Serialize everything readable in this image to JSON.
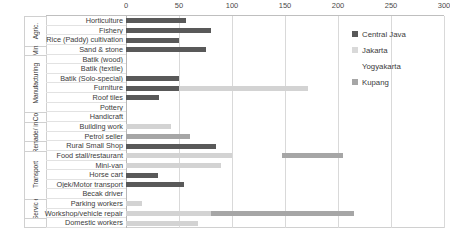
{
  "chart_data": {
    "type": "bar",
    "orientation": "horizontal",
    "title": "",
    "xlabel": "",
    "ylabel": "",
    "xlim": [
      0,
      300
    ],
    "xticks": [
      0,
      50,
      100,
      150,
      200,
      250,
      300
    ],
    "grid": true,
    "legend_position": "top-right",
    "legend": [
      "Central Java",
      "Jakarta",
      "Yogyakarta",
      "Kupang"
    ],
    "colors": {
      "Central Java": "#595959",
      "Jakarta": "#d3d3d3",
      "Yogyakarta": "#f2f2f2",
      "Kupang": "#a6a6a6"
    },
    "groups": [
      {
        "label": "Agric.",
        "rows": 3
      },
      {
        "label": "Min.",
        "rows": 1
      },
      {
        "label": "Manufacturing",
        "rows": 6
      },
      {
        "label": "Co",
        "rows": 1
      },
      {
        "label": "Trade/ inst",
        "rows": 2
      },
      {
        "label": "Rent.",
        "rows": 1
      },
      {
        "label": "Transport",
        "rows": 5
      },
      {
        "label": "Servic e",
        "rows": 2
      }
    ],
    "categories": [
      "Horticulture",
      "Fishery",
      "Rice (Paddy) cultivation",
      "Sand & stone",
      "Batik (wood)",
      "Batik (textile)",
      "Batik (Solo-special)",
      "Furniture",
      "Roof tiles",
      "Pottery",
      "Handicraft",
      "Building work",
      "Petrol seller",
      "Rural Small Shop",
      "Food stall/restaurant",
      "Mini-van",
      "Horse cart",
      "Ojek/Motor transport",
      "Becak driver",
      "Parking workers",
      "Workshop/vehicle repair",
      "Domestic workers"
    ],
    "series": [
      {
        "name": "Central Java",
        "values": [
          57,
          80,
          50,
          75,
          0,
          0,
          50,
          50,
          31,
          0,
          0,
          0,
          0,
          85,
          0,
          0,
          30,
          55,
          0,
          0,
          0,
          0
        ]
      },
      {
        "name": "Jakarta",
        "values": [
          0,
          0,
          0,
          0,
          0,
          0,
          0,
          122,
          0,
          0,
          0,
          42,
          0,
          0,
          100,
          90,
          0,
          0,
          0,
          15,
          80,
          68
        ]
      },
      {
        "name": "Yogyakarta",
        "values": [
          0,
          0,
          0,
          0,
          0,
          0,
          0,
          0,
          0,
          0,
          0,
          0,
          0,
          0,
          0,
          0,
          0,
          0,
          0,
          0,
          0,
          0
        ]
      },
      {
        "name": "Kupang",
        "values": [
          0,
          0,
          0,
          0,
          0,
          0,
          0,
          0,
          0,
          0,
          0,
          0,
          60,
          0,
          0,
          0,
          0,
          0,
          0,
          0,
          135,
          0
        ]
      }
    ],
    "segments": [
      {
        "row": 14,
        "series": "Kupang",
        "start": 147,
        "end": 205
      }
    ]
  }
}
